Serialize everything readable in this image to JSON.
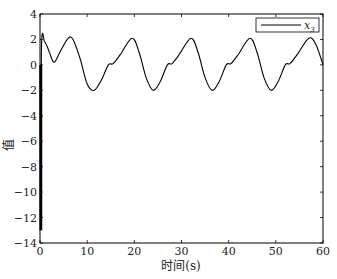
{
  "chart_data": {
    "type": "line",
    "title": "",
    "xlabel": "时间(s)",
    "ylabel": "值",
    "xlim": [
      0,
      60
    ],
    "ylim": [
      -14,
      4
    ],
    "xticks": [
      0,
      10,
      20,
      30,
      40,
      50,
      60
    ],
    "yticks": [
      4,
      2,
      0,
      -2,
      -4,
      -6,
      -8,
      -10,
      -12,
      -14
    ],
    "grid": false,
    "legend": {
      "position": "upper right",
      "entries": [
        "x3"
      ]
    },
    "series": [
      {
        "name": "x3",
        "color": "#000000",
        "x": [
          0,
          0.05,
          0.3,
          1.0,
          2.0,
          3.0,
          4.5,
          6.0,
          7.0,
          8.5,
          10.0,
          11.5,
          13.0,
          14.5,
          15.5,
          17.0,
          19.5,
          21.0,
          22.5,
          24.0,
          25.5,
          27.0,
          28.0,
          29.5,
          32.0,
          33.5,
          35.0,
          36.5,
          38.0,
          39.5,
          40.5,
          42.0,
          44.5,
          46.0,
          47.5,
          49.0,
          50.5,
          52.0,
          53.0,
          54.5,
          57.0,
          58.5,
          60.0
        ],
        "y": [
          0,
          -13,
          1.2,
          1.8,
          1.0,
          0.2,
          1.2,
          2.1,
          2.0,
          0.5,
          -1.5,
          -2.0,
          -1.2,
          0.0,
          0.1,
          0.8,
          2.1,
          1.0,
          -1.0,
          -2.0,
          -1.3,
          0.0,
          0.1,
          0.8,
          2.1,
          1.0,
          -1.0,
          -2.0,
          -1.3,
          0.0,
          0.1,
          0.8,
          2.1,
          1.0,
          -1.0,
          -2.0,
          -1.3,
          0.0,
          0.1,
          0.8,
          2.1,
          1.6,
          0
        ]
      }
    ]
  },
  "labels": {
    "xlabel": "时间(s)",
    "ylabel": "值",
    "legend_x": "x",
    "legend_sub": "3",
    "xticks": [
      "0",
      "10",
      "20",
      "30",
      "40",
      "50",
      "60"
    ],
    "yticks": [
      "4",
      "2",
      "0",
      "−2",
      "−4",
      "−6",
      "−8",
      "−10",
      "−12",
      "−14"
    ]
  }
}
